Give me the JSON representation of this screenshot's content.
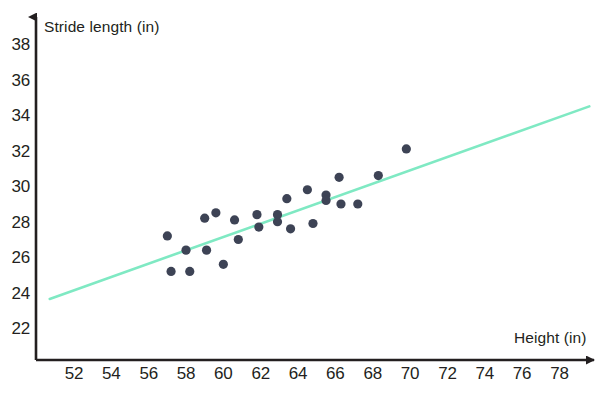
{
  "chart_data": {
    "type": "scatter",
    "title": "",
    "xlabel": "Height (in)",
    "ylabel": "Stride length (in)",
    "xlim": [
      50.6,
      79.6
    ],
    "ylim": [
      20.6,
      39.2
    ],
    "grid": false,
    "legend": "none",
    "point_color": "#3d4355",
    "line_color": "#7fe9c3",
    "xticks": [
      52,
      54,
      56,
      58,
      60,
      62,
      64,
      66,
      68,
      70,
      72,
      74,
      76,
      78
    ],
    "yticks": [
      22,
      24,
      26,
      28,
      30,
      32,
      34,
      36,
      38
    ],
    "xtick_labels": [
      "52",
      "54",
      "56",
      "58",
      "60",
      "62",
      "64",
      "66",
      "68",
      "70",
      "72",
      "74",
      "76",
      "78"
    ],
    "ytick_labels": [
      "22",
      "24",
      "26",
      "28",
      "30",
      "32",
      "34",
      "36",
      "38"
    ],
    "points": [
      {
        "x": 57.0,
        "y": 27.3
      },
      {
        "x": 57.2,
        "y": 25.3
      },
      {
        "x": 58.0,
        "y": 26.5
      },
      {
        "x": 58.2,
        "y": 25.3
      },
      {
        "x": 59.0,
        "y": 28.3
      },
      {
        "x": 59.1,
        "y": 26.5
      },
      {
        "x": 59.6,
        "y": 28.6
      },
      {
        "x": 60.0,
        "y": 25.7
      },
      {
        "x": 60.6,
        "y": 28.2
      },
      {
        "x": 60.8,
        "y": 27.1
      },
      {
        "x": 61.8,
        "y": 28.5
      },
      {
        "x": 61.9,
        "y": 27.8
      },
      {
        "x": 62.9,
        "y": 28.5
      },
      {
        "x": 62.9,
        "y": 28.1
      },
      {
        "x": 63.4,
        "y": 29.4
      },
      {
        "x": 63.6,
        "y": 27.7
      },
      {
        "x": 64.5,
        "y": 29.9
      },
      {
        "x": 64.8,
        "y": 28.0
      },
      {
        "x": 65.5,
        "y": 29.6
      },
      {
        "x": 65.5,
        "y": 29.3
      },
      {
        "x": 66.2,
        "y": 30.6
      },
      {
        "x": 66.3,
        "y": 29.1
      },
      {
        "x": 67.2,
        "y": 29.1
      },
      {
        "x": 68.3,
        "y": 30.7
      },
      {
        "x": 69.8,
        "y": 32.2
      }
    ],
    "trend_line": {
      "label": "line of best fit",
      "x_start": 50.7,
      "y_start": 23.75,
      "x_end": 79.6,
      "y_end": 34.6
    },
    "n_points": 25
  }
}
